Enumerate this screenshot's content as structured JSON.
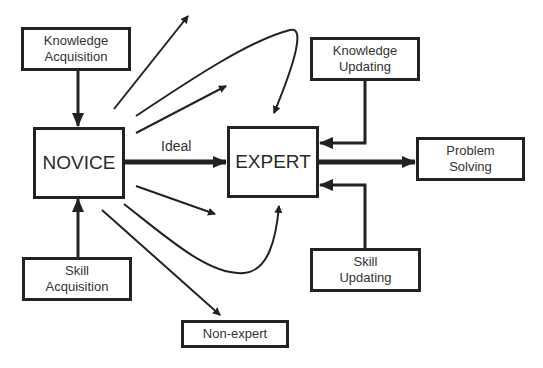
{
  "diagram": {
    "nodes": {
      "knowledge_acquisition": "Knowledge\nAcquisition",
      "novice": "NOVICE",
      "skill_acquisition": "Skill\nAcquisition",
      "expert": "EXPERT",
      "knowledge_updating": "Knowledge\nUpdating",
      "skill_updating": "Skill\nUpdating",
      "problem_solving": "Problem\nSolving",
      "non_expert": "Non-expert"
    },
    "edge_labels": {
      "ideal": "Ideal"
    },
    "edges": [
      {
        "from": "Knowledge Acquisition",
        "to": "NOVICE"
      },
      {
        "from": "Skill Acquisition",
        "to": "NOVICE"
      },
      {
        "from": "NOVICE",
        "to": "EXPERT",
        "label": "Ideal"
      },
      {
        "from": "Knowledge Updating",
        "to": "EXPERT"
      },
      {
        "from": "Skill Updating",
        "to": "EXPERT"
      },
      {
        "from": "EXPERT",
        "to": "Problem Solving"
      },
      {
        "from": "NOVICE",
        "to": "Non-expert"
      },
      {
        "from": "NOVICE",
        "to": "EXPERT",
        "style": "curved-over"
      },
      {
        "from": "NOVICE",
        "to": "EXPERT",
        "style": "curved-under"
      },
      {
        "from": "NOVICE",
        "to": "(off-path)",
        "count": 3
      }
    ]
  }
}
